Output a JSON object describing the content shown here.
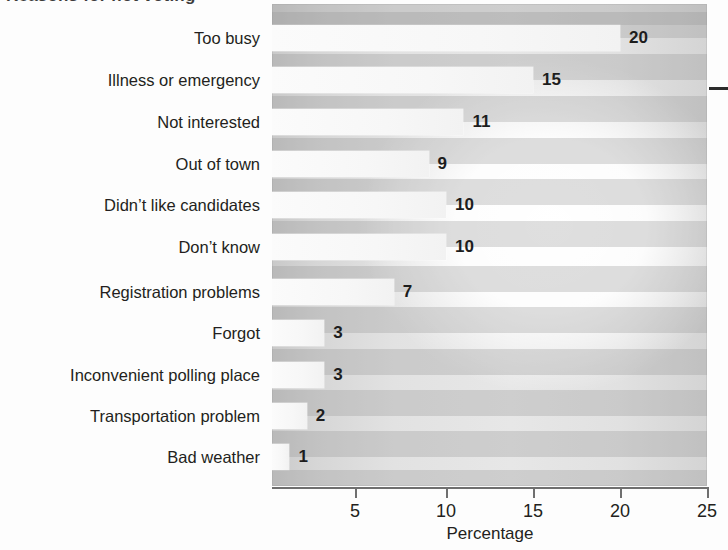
{
  "figure": {
    "title_cropped": "Reasons for not voting",
    "background_color": "#fdfdfd",
    "plot_background_color": "#e3e3e3",
    "band_color": "#a6a6a6",
    "bar_color": "#f8f8f8",
    "text_color": "#231f20"
  },
  "axis": {
    "x_title": "Percentage",
    "tick_labels": [
      "5",
      "10",
      "15",
      "20",
      "25"
    ],
    "tick_values": [
      5,
      10,
      15,
      20,
      25
    ],
    "x_min": 0,
    "x_max": 25
  },
  "marks": {
    "right_edge_rule": "horizontal-rule"
  },
  "chart_data": {
    "type": "bar",
    "orientation": "horizontal",
    "title": "Reasons for not voting",
    "xlabel": "Percentage",
    "ylabel": "",
    "xlim": [
      0,
      25
    ],
    "grid": false,
    "legend": "none",
    "value_labels": true,
    "categories": [
      "Too busy",
      "Illness or emergency",
      "Not interested",
      "Out of town",
      "Didn’t like candidates",
      "Don’t know",
      "Registration problems",
      "Forgot",
      "Inconvenient polling place",
      "Transportation problem",
      "Bad weather"
    ],
    "values": [
      20,
      15,
      11,
      9,
      10,
      10,
      7,
      3,
      3,
      2,
      1
    ],
    "labels": [
      "20",
      "15",
      "11",
      "9",
      "10",
      "10",
      "7",
      "3",
      "3",
      "2",
      "1"
    ]
  },
  "geometry": {
    "row_centers": [
      38,
      80,
      122,
      164,
      205,
      247,
      292,
      333,
      375,
      416,
      457
    ],
    "row_height": 26,
    "plot_left": 272,
    "plot_right": 707,
    "px_per_unit": 17.4,
    "tick_x": [
      355,
      446,
      533,
      620,
      707
    ]
  }
}
